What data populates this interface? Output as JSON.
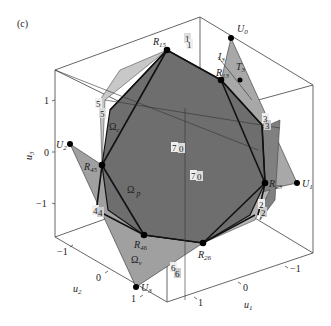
{
  "panel_label": "(c)",
  "axes": {
    "u1": {
      "label": "u",
      "sub": "1",
      "ticks": [
        "1",
        "0",
        "−1"
      ]
    },
    "u2": {
      "label": "u",
      "sub": "2",
      "ticks": [
        "−1",
        "0",
        "1"
      ]
    },
    "u3": {
      "label": "u",
      "sub": "3",
      "ticks": [
        "1",
        "0",
        "−1"
      ]
    }
  },
  "vertices": {
    "U0": {
      "label": "U",
      "sub": "0"
    },
    "U1": {
      "label": "U",
      "sub": "1"
    },
    "U2": {
      "label": "U",
      "sub": "2"
    },
    "U3": {
      "label": "U",
      "sub": "3"
    },
    "R15": {
      "label": "R",
      "sub": "15"
    },
    "R13": {
      "label": "R",
      "sub": "13"
    },
    "R23": {
      "label": "R",
      "sub": "23"
    },
    "R26": {
      "label": "R",
      "sub": "26"
    },
    "R46": {
      "label": "R",
      "sub": "46"
    },
    "R45": {
      "label": "R",
      "sub": "45"
    },
    "T3": {
      "label": "T",
      "sub": "3"
    },
    "I3": {
      "label": "I",
      "sub": "3"
    }
  },
  "regions": {
    "omega_p": {
      "label": "Ω",
      "sub": "p"
    },
    "omega_c": {
      "label": "Ω",
      "sub": "c"
    },
    "omega_v": {
      "label": "Ω",
      "sub": "v"
    }
  },
  "face_numbers": [
    "1",
    "1",
    "3",
    "3",
    "5",
    "5",
    "4",
    "4",
    "6",
    "6",
    "2",
    "2",
    "7",
    "0",
    "7",
    "0"
  ],
  "colors": {
    "dark_polygon": "#6e6e6e",
    "mid_polygon": "#9a9a9a",
    "light_polygon": "#c4c4c4",
    "edge": "#111111",
    "box": "#444444"
  }
}
